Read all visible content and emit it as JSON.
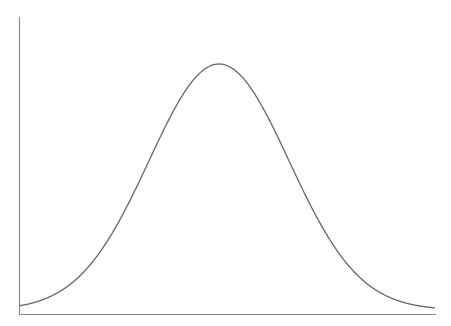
{
  "chart_data": {
    "type": "line",
    "title": "",
    "xlabel": "",
    "ylabel": "",
    "series": [
      {
        "name": "normal-density",
        "function": "gaussian",
        "mean": 0,
        "std": 1,
        "x": [
          -3,
          -2.5,
          -2,
          -1.5,
          -1,
          -0.5,
          0,
          0.5,
          1,
          1.5,
          2,
          2.5,
          3
        ],
        "values": [
          0.0044,
          0.0175,
          0.054,
          0.1295,
          0.242,
          0.3521,
          0.3989,
          0.3521,
          0.242,
          0.1295,
          0.054,
          0.0175,
          0.0044
        ]
      }
    ],
    "xlim": [
      -3,
      3
    ],
    "ylim": [
      0,
      0.4
    ],
    "grid": false,
    "legend": null,
    "axes": {
      "show_y_axis": true,
      "show_x_axis": true,
      "ticks": false
    }
  },
  "style": {
    "axis_color": "#8a8a8a",
    "curve_color": "#666666",
    "background": "#ffffff"
  },
  "geometry": {
    "plot_left": 19,
    "plot_right": 436,
    "plot_top": 17,
    "baseline": 314,
    "peak_x": 219,
    "peak_y": 64,
    "sigma_px": 70,
    "curve_x_start": 20,
    "curve_x_end": 435
  }
}
